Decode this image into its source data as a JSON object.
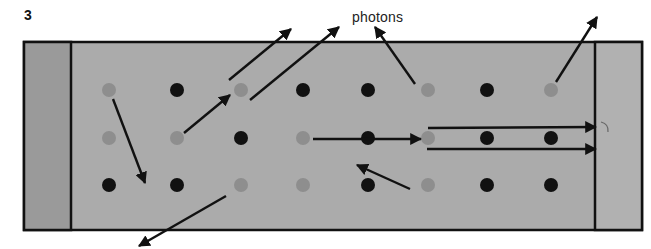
{
  "figure": {
    "number": "3",
    "label": "photons"
  },
  "colors": {
    "center_fill": "#ababab",
    "left_panel_fill": "#9a9a9a",
    "right_panel_fill": "#b1b1b1",
    "border": "#111111",
    "excited_atom": "#8e8e8e",
    "ground_atom": "#111111",
    "arrow": "#111111"
  },
  "frame": {
    "x": 24,
    "y": 42,
    "width": 618,
    "height": 188,
    "left_mirror_right_edge": 71,
    "right_mirror_left_edge": 595
  },
  "atoms": {
    "radius": 7,
    "columns_x": [
      109,
      177,
      241,
      303,
      368,
      428,
      487,
      551
    ],
    "rows": [
      {
        "y": 90,
        "states": [
          "excited",
          "ground",
          "excited",
          "ground",
          "ground",
          "excited",
          "ground",
          "excited"
        ]
      },
      {
        "y": 138,
        "states": [
          "excited",
          "excited",
          "ground",
          "excited",
          "ground",
          "excited",
          "ground",
          "ground"
        ]
      },
      {
        "y": 185,
        "states": [
          "ground",
          "ground",
          "excited",
          "excited",
          "ground",
          "excited",
          "ground",
          "ground"
        ]
      }
    ]
  },
  "arrows": [
    {
      "name": "photon-down-from-left-atom",
      "x1": 113,
      "y1": 99,
      "x2": 145,
      "y2": 183
    },
    {
      "name": "photon-up-right-short",
      "x1": 184,
      "y1": 133,
      "x2": 230,
      "y2": 95
    },
    {
      "name": "photon-escape-top-1",
      "x1": 229,
      "y1": 80,
      "x2": 291,
      "y2": 29
    },
    {
      "name": "photon-escape-top-2",
      "x1": 250,
      "y1": 100,
      "x2": 339,
      "y2": 27
    },
    {
      "name": "photon-to-label",
      "x1": 415,
      "y1": 84,
      "x2": 375,
      "y2": 27
    },
    {
      "name": "photon-escape-top-right",
      "x1": 556,
      "y1": 82,
      "x2": 597,
      "y2": 17
    },
    {
      "name": "photon-stimulated-horizontal",
      "x1": 313,
      "y1": 139,
      "x2": 421,
      "y2": 139
    },
    {
      "name": "photon-up-left",
      "x1": 410,
      "y1": 189,
      "x2": 357,
      "y2": 165
    },
    {
      "name": "photon-beam-upper",
      "x1": 428,
      "y1": 128,
      "x2": 596,
      "y2": 127
    },
    {
      "name": "photon-beam-lower",
      "x1": 427,
      "y1": 149,
      "x2": 596,
      "y2": 149
    },
    {
      "name": "photon-escape-bottom",
      "x1": 226,
      "y1": 196,
      "x2": 139,
      "y2": 246
    }
  ]
}
